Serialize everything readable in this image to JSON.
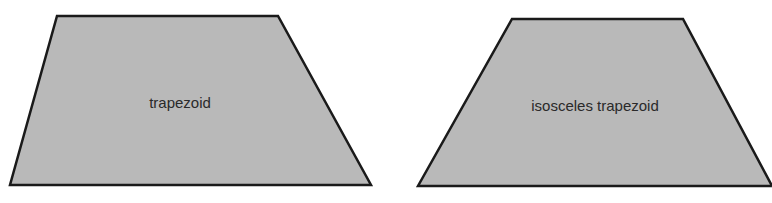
{
  "diagram": {
    "fill_color": "#b9b9b9",
    "stroke_color": "#1a1a1a",
    "shapes": [
      {
        "name": "trapezoid",
        "label": "trapezoid",
        "points": "57,16 278,16 371,185 10,185",
        "label_x": 180,
        "label_y": 108
      },
      {
        "name": "isosceles-trapezoid",
        "label": "isosceles trapezoid",
        "points": "512,19 683,19 772,186 418,186",
        "label_x": 595,
        "label_y": 111
      }
    ]
  }
}
